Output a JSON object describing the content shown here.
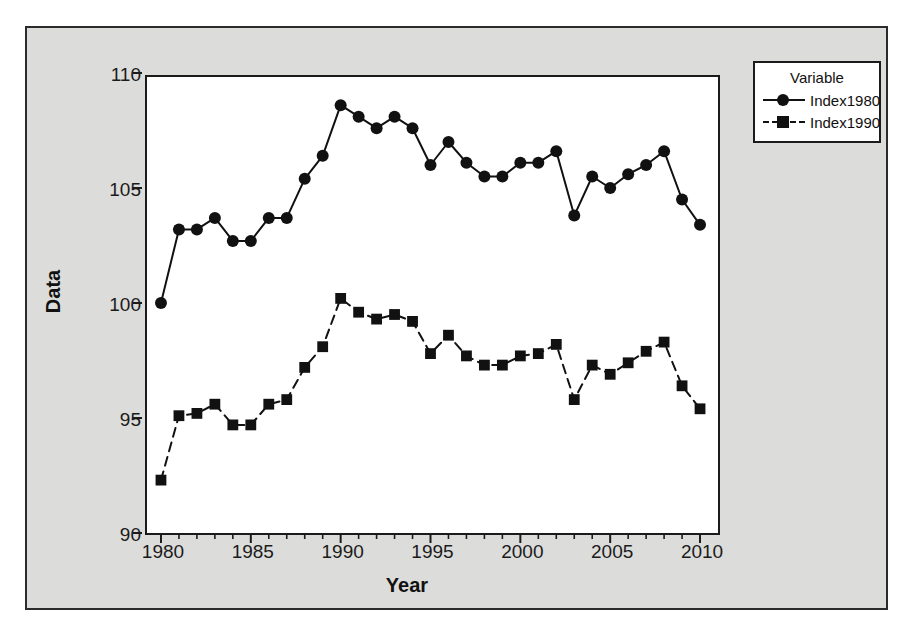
{
  "chart_data": {
    "type": "line",
    "title": "",
    "xlabel": "Year",
    "ylabel": "Data",
    "legend_title": "Variable",
    "legend_position": "right-top",
    "grid": false,
    "xlim": [
      1979,
      2011
    ],
    "ylim": [
      90,
      110
    ],
    "xticks": [
      1980,
      1985,
      1990,
      1995,
      2000,
      2005,
      2010
    ],
    "xtick_labels": [
      "1980",
      "1985",
      "1990",
      "1995",
      "2000",
      "2005",
      "2010"
    ],
    "yticks": [
      90,
      95,
      100,
      105,
      110
    ],
    "ytick_labels": [
      "90",
      "95",
      "100",
      "105",
      "110"
    ],
    "minor_xtick_step": 1,
    "x": [
      1980,
      1981,
      1982,
      1983,
      1984,
      1985,
      1986,
      1987,
      1988,
      1989,
      1990,
      1991,
      1992,
      1993,
      1994,
      1995,
      1996,
      1997,
      1998,
      1999,
      2000,
      2001,
      2002,
      2003,
      2004,
      2005,
      2006,
      2007,
      2008,
      2009,
      2010
    ],
    "series": [
      {
        "name": "Index1980",
        "marker": "circle",
        "linestyle": "solid",
        "color": "#111111",
        "values": [
          100.0,
          103.2,
          103.2,
          103.7,
          102.7,
          102.7,
          103.7,
          103.7,
          105.4,
          106.4,
          108.6,
          108.1,
          107.6,
          108.1,
          107.6,
          106.0,
          107.0,
          106.1,
          105.5,
          105.5,
          106.1,
          106.1,
          106.6,
          103.8,
          105.5,
          105.0,
          105.6,
          106.0,
          106.6,
          104.5,
          103.4
        ]
      },
      {
        "name": "Index1990",
        "marker": "square",
        "linestyle": "dashed",
        "color": "#111111",
        "values": [
          92.3,
          95.1,
          95.2,
          95.6,
          94.7,
          94.7,
          95.6,
          95.8,
          97.2,
          98.1,
          100.2,
          99.6,
          99.3,
          99.5,
          99.2,
          97.8,
          98.6,
          97.7,
          97.3,
          97.3,
          97.7,
          97.8,
          98.2,
          95.8,
          97.3,
          96.9,
          97.4,
          97.9,
          98.3,
          96.4,
          95.4
        ]
      }
    ]
  },
  "legend": {
    "title": "Variable",
    "entries": [
      {
        "label": "Index1980",
        "marker": "circle",
        "linestyle": "solid"
      },
      {
        "label": "Index1990",
        "marker": "square",
        "linestyle": "dashed"
      }
    ]
  },
  "axes": {
    "x_title": "Year",
    "y_title": "Data"
  },
  "colors": {
    "figure_background": "#dcdcda",
    "panel_background": "#ffffff",
    "ink": "#111111",
    "border": "#1b1b1b",
    "page_background": "#ffffff"
  }
}
